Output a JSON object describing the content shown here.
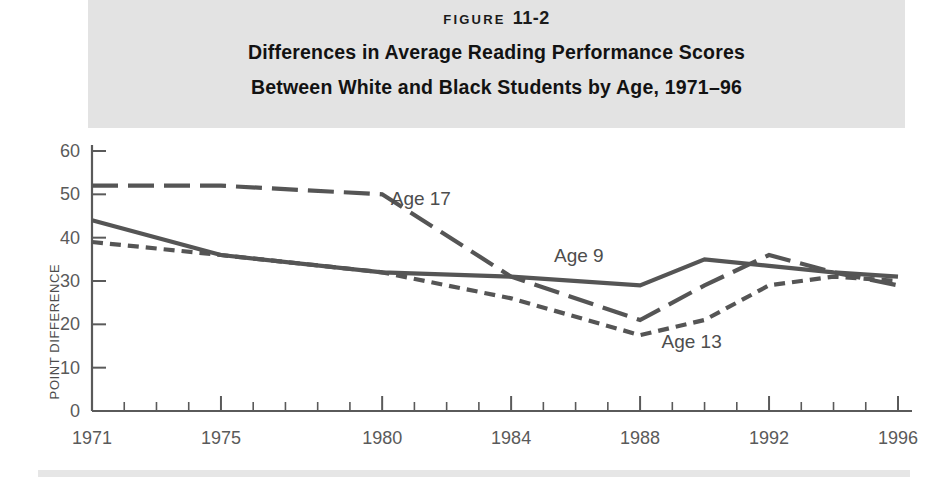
{
  "figure": {
    "number_word": "FIGURE",
    "number_value": "11-2",
    "title_line1": "Differences in Average Reading Performance Scores",
    "title_line2": "Between White and Black Students by Age, 1971–96"
  },
  "colors": {
    "header_band": "#e3e3e3",
    "page_background": "#ffffff",
    "line": "#555555",
    "axis": "#5a5a5a",
    "tick_text": "#5a5a5a",
    "title_text": "#121212"
  },
  "chart_data": {
    "type": "line",
    "xlabel": "",
    "ylabel": "POINT DIFFERENCE",
    "xlim": [
      1971,
      1996
    ],
    "ylim": [
      0,
      60
    ],
    "yticks": [
      0,
      10,
      20,
      30,
      40,
      50,
      60
    ],
    "ytick_labels": [
      "0",
      "10",
      "20",
      "30",
      "40",
      "50",
      "60"
    ],
    "xticks_major": [
      1971,
      1975,
      1980,
      1984,
      1988,
      1992,
      1996
    ],
    "xtick_labels": [
      "1971",
      "1975",
      "1980",
      "1984",
      "1988",
      "1992",
      "1996"
    ],
    "xticks_minor": [
      1972,
      1973,
      1974,
      1976,
      1977,
      1978,
      1979,
      1981,
      1982,
      1983,
      1985,
      1986,
      1987,
      1989,
      1990,
      1991,
      1993,
      1994,
      1995
    ],
    "grid": false,
    "legend_position": "inline-annotations",
    "series": [
      {
        "name": "Age 17",
        "label": "Age 17",
        "style": "long-dash",
        "dash": "26,10",
        "label_x": 1981.2,
        "label_y": 47.5,
        "x": [
          1971,
          1975,
          1980,
          1984,
          1988,
          1990,
          1992,
          1994,
          1996
        ],
        "values": [
          52,
          52,
          50,
          31,
          21,
          29,
          36,
          32,
          29
        ]
      },
      {
        "name": "Age 13",
        "label": "Age 13",
        "style": "short-dash",
        "dash": "11,7",
        "label_x": 1989.6,
        "label_y": 14.5,
        "x": [
          1971,
          1975,
          1980,
          1984,
          1988,
          1990,
          1992,
          1994,
          1996
        ],
        "values": [
          39,
          36,
          32,
          26,
          17.5,
          21,
          29,
          31,
          30
        ]
      },
      {
        "name": "Age 9",
        "label": "Age 9",
        "style": "solid",
        "dash": "",
        "label_x": 1986.1,
        "label_y": 34.5,
        "x": [
          1971,
          1975,
          1980,
          1984,
          1988,
          1990,
          1992,
          1994,
          1996
        ],
        "values": [
          44,
          36,
          32,
          31,
          29,
          35,
          33.5,
          32,
          31
        ]
      }
    ]
  }
}
